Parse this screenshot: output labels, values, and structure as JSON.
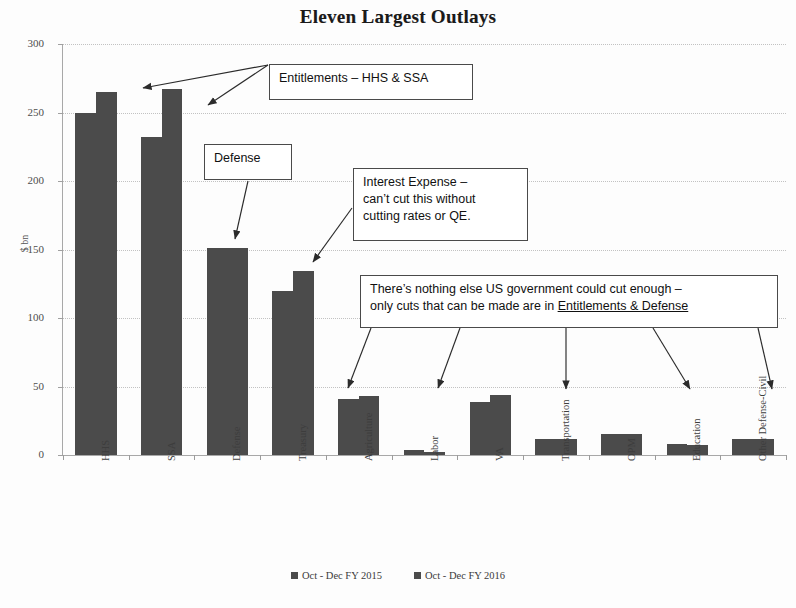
{
  "chart_data": {
    "type": "bar",
    "title": "Eleven Largest Outlays",
    "xlabel": "",
    "ylabel": "$ bn",
    "ylim": [
      0,
      300
    ],
    "yticks": [
      0,
      50,
      100,
      150,
      200,
      250,
      300
    ],
    "grid": true,
    "legend_position": "bottom",
    "categories": [
      "HHS",
      "SSA",
      "Defense",
      "Treasury",
      "Agriculture",
      "Labor",
      "VA",
      "Transportation",
      "OPM",
      "Education",
      "Other Defense-Civil"
    ],
    "series": [
      {
        "name": "Oct - Dec FY 2015",
        "values": [
          250,
          232,
          151,
          120,
          41,
          4,
          39,
          12,
          15,
          8,
          12
        ]
      },
      {
        "name": "Oct - Dec FY 2016",
        "values": [
          265,
          267,
          151,
          134,
          43,
          2,
          44,
          12,
          15,
          7,
          12
        ]
      }
    ],
    "annotations": [
      "Entitlements – HHS & SSA",
      "Defense",
      "Interest Expense – can’t cut this without cutting rates or QE.",
      "There’s nothing else US government could cut enough – only cuts that can be made are in Entitlements & Defense"
    ]
  },
  "axis": {
    "y_title": "$ bn",
    "y_tick_labels": [
      "300",
      "250",
      "200",
      "150",
      "100",
      "50",
      "0"
    ],
    "x_tick_labels": [
      "HHS",
      "SSA",
      "Defense",
      "Treasury",
      "Agriculture",
      "Labor",
      "VA",
      "Transportation",
      "OPM",
      "Education",
      "Other Defense-Civil"
    ]
  },
  "legend": {
    "entries": [
      {
        "label": "Oct - Dec FY 2015",
        "color": "#4b4b4b"
      },
      {
        "label": "Oct - Dec FY 2016",
        "color": "#4b4b4b"
      }
    ]
  },
  "callouts": {
    "entitlements": {
      "text": "Entitlements – HHS & SSA"
    },
    "defense": {
      "text": "Defense"
    },
    "interest": {
      "line1": "Interest Expense –",
      "line2": "can’t cut this without",
      "line3": "cutting rates or QE."
    },
    "nothing_else": {
      "line1": "There’s nothing else US government could cut enough –",
      "line2_pre": "only cuts that can be made are in ",
      "line2_underlined": "Entitlements & Defense"
    }
  },
  "colors": {
    "bar": "#4b4b4b",
    "axis": "#a8a8a8",
    "grid": "#c2c2c2",
    "callout_border": "#4a4a4a",
    "text": "#111111"
  }
}
